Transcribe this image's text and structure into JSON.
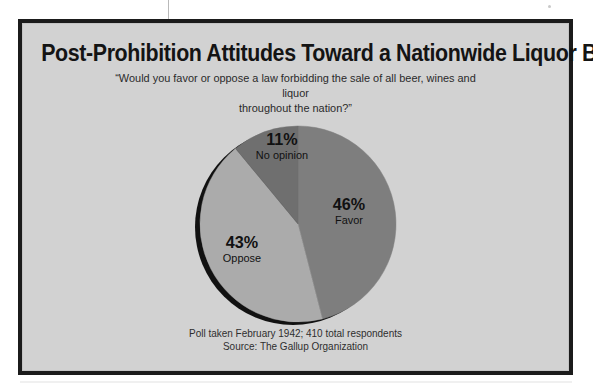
{
  "chart_data": {
    "type": "pie",
    "title": "Post-Prohibition Attitudes Toward a Nationwide Liquor Ban",
    "subtitle_line1": "“Would you favor or oppose a law forbidding the sale of all beer, wines and liquor",
    "subtitle_line2": "throughout the nation?”",
    "categories": [
      "Favor",
      "Oppose",
      "No opinion"
    ],
    "values": [
      46,
      43,
      11
    ],
    "value_labels": [
      "46%",
      "43%",
      "11%"
    ],
    "unit": "percent",
    "slice_colors": [
      "#7e7e7e",
      "#ababab",
      "#6f6f6f"
    ],
    "start_angle_deg": 0,
    "direction": "clockwise",
    "legend": "none",
    "labels_inside": true,
    "shadow_color": "#111111",
    "background": "#d2d2d2",
    "slices": [
      {
        "label": "Favor",
        "value": 46,
        "value_label": "46%",
        "color": "#7e7e7e"
      },
      {
        "label": "Oppose",
        "value": 43,
        "value_label": "43%",
        "color": "#ababab"
      },
      {
        "label": "No opinion",
        "value": 11,
        "value_label": "11%",
        "color": "#6f6f6f"
      }
    ],
    "footnote_line1": "Poll taken February 1942; 410 total respondents",
    "footnote_line2": "Source: The Gallup Organization",
    "xlabel": "",
    "ylabel": ""
  },
  "frame": {
    "border_color": "#1b1b1b",
    "fill_color": "#d2d2d2"
  }
}
